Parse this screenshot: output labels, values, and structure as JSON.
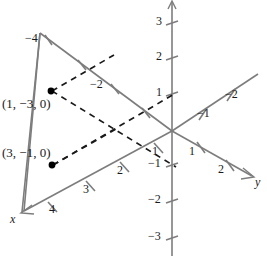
{
  "figure": {
    "kind": "3d-coordinate-axes-plot",
    "colors": {
      "axis": "#7d7d7d",
      "dashed": "#1a1a1a",
      "point": "#000000",
      "text": "#1a1a1a",
      "background": "#ffffff"
    },
    "axes": [
      {
        "id": "x",
        "name": "x",
        "name_pos": {
          "x": 11,
          "y": 213
        },
        "direction": "down-left positive, up-right negative",
        "ticks": [
          {
            "label": "1",
            "x": 152,
            "y": 152
          },
          {
            "label": "2",
            "x": 118,
            "y": 171
          },
          {
            "label": "3",
            "x": 84,
            "y": 190
          },
          {
            "label": "4",
            "x": 50,
            "y": 210
          },
          {
            "label": "−2",
            "x": 93,
            "y": 85
          },
          {
            "label": "−4",
            "x": 27,
            "y": 39
          }
        ]
      },
      {
        "id": "y",
        "name": "y",
        "name_pos": {
          "x": 255,
          "y": 176
        },
        "direction": "down-right positive, up-right negative",
        "ticks": [
          {
            "label": "1",
            "x": 190,
            "y": 152
          },
          {
            "label": "2",
            "x": 219,
            "y": 170
          },
          {
            "label": "−1",
            "x": 200,
            "y": 114
          },
          {
            "label": "−2",
            "x": 228,
            "y": 95
          }
        ]
      },
      {
        "id": "z",
        "name": "",
        "direction": "vertical",
        "ticks": [
          {
            "label": "3",
            "x": 157,
            "y": 21
          },
          {
            "label": "2",
            "x": 157,
            "y": 56
          },
          {
            "label": "1",
            "x": 157,
            "y": 92
          },
          {
            "label": "−1",
            "x": 150,
            "y": 163
          },
          {
            "label": "−2",
            "x": 150,
            "y": 199
          },
          {
            "label": "−3",
            "x": 150,
            "y": 236
          }
        ]
      }
    ],
    "points": [
      {
        "label": "(1, −3, 0)",
        "label_pos": {
          "x": 2,
          "y": 104
        },
        "dot": {
          "x": 51,
          "y": 91
        }
      },
      {
        "label": "(3, −1, 0)",
        "label_pos": {
          "x": 2,
          "y": 153
        },
        "dot": {
          "x": 52,
          "y": 165
        }
      }
    ]
  }
}
